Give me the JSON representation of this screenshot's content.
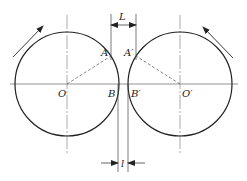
{
  "diagram": {
    "labels": {
      "O": "O",
      "O_prime": "O′",
      "A": "A",
      "A_prime": "A′",
      "B": "B",
      "B_prime": "B′",
      "L": "L",
      "l": "l"
    },
    "circles": [
      {
        "name": "left-roll",
        "center_label": "O",
        "cx": 67,
        "cy": 84,
        "r": 52
      },
      {
        "name": "right-roll",
        "center_label": "O′",
        "cx": 180,
        "cy": 84,
        "r": 52
      }
    ],
    "rotation_arrows": [
      {
        "name": "left-roll-rotation",
        "direction": "up-right"
      },
      {
        "name": "right-roll-rotation",
        "direction": "up-left"
      }
    ],
    "colors": {
      "stroke": "#222222",
      "centerline": "#777777",
      "background": "#ffffff"
    }
  }
}
